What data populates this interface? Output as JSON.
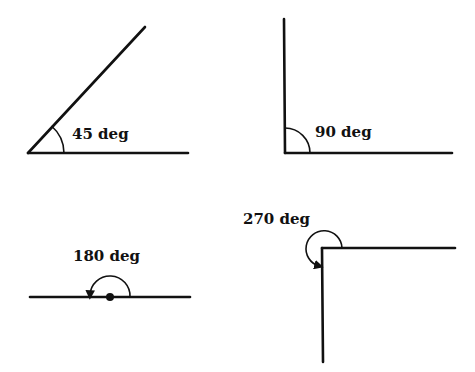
{
  "diagram": {
    "title": "",
    "colors": {
      "stroke": "#111111",
      "background": "#ffffff"
    },
    "angles": [
      {
        "id": "angle-45",
        "label": "45 deg",
        "degrees": 45
      },
      {
        "id": "angle-90",
        "label": "90 deg",
        "degrees": 90
      },
      {
        "id": "angle-180",
        "label": "180 deg",
        "degrees": 180
      },
      {
        "id": "angle-270",
        "label": "270 deg",
        "degrees": 270
      }
    ]
  }
}
